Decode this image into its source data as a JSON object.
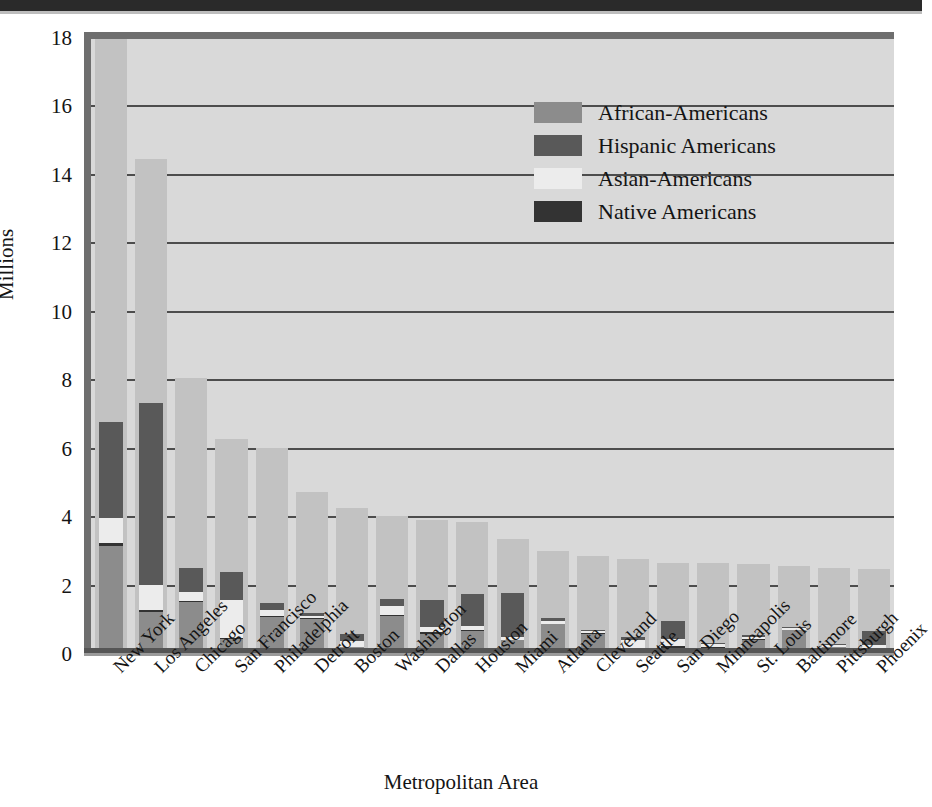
{
  "axis": {
    "y_label": "Millions",
    "x_label": "Metropolitan Area",
    "y_ticks": [
      "0",
      "2",
      "4",
      "6",
      "8",
      "10",
      "12",
      "14",
      "16",
      "18"
    ]
  },
  "legend": {
    "items": [
      {
        "label": "African-Americans",
        "color": "#8c8c8c"
      },
      {
        "label": "Hispanic Americans",
        "color": "#595959"
      },
      {
        "label": "Asian-Americans",
        "color": "#ececec"
      },
      {
        "label": "Native Americans",
        "color": "#333333"
      }
    ]
  },
  "chart_data": {
    "type": "bar",
    "subtype": "stacked-bar-with-total-background",
    "title": "",
    "xlabel": "Metropolitan Area",
    "ylabel": "Millions",
    "ylim": [
      0,
      18
    ],
    "yticks": [
      0,
      2,
      4,
      6,
      8,
      10,
      12,
      14,
      16,
      18
    ],
    "grid": true,
    "legend_position": "inside-top-right",
    "categories": [
      "New York",
      "Los Angeles",
      "Chicago",
      "San Francisco",
      "Philadelphia",
      "Detroit",
      "Boston",
      "Washington",
      "Dallas",
      "Houston",
      "Miami",
      "Atlanta",
      "Cleveland",
      "Seattle",
      "San Diego",
      "Minneapolis",
      "St. Louis",
      "Baltimore",
      "Pittsburgh",
      "Phoenix"
    ],
    "total_series": {
      "name": "Total metropolitan population",
      "color": "#c2c2c2",
      "values": [
        19.8,
        14.5,
        8.1,
        6.3,
        6.05,
        4.75,
        4.3,
        4.05,
        3.95,
        3.9,
        3.4,
        3.05,
        2.9,
        2.8,
        2.7,
        2.7,
        2.65,
        2.6,
        2.55,
        2.5
      ]
    },
    "series": [
      {
        "name": "African-Americans",
        "color": "#8c8c8c",
        "values": [
          3.2,
          1.25,
          1.55,
          0.48,
          1.12,
          1.05,
          0.22,
          1.15,
          0.62,
          0.7,
          0.43,
          0.9,
          0.62,
          0.16,
          0.2,
          0.18,
          0.45,
          0.72,
          0.22,
          0.12
        ]
      },
      {
        "name": "Native Americans",
        "color": "#333333",
        "values": [
          0.08,
          0.07,
          0.03,
          0.02,
          0.03,
          0.03,
          0.02,
          0.02,
          0.04,
          0.03,
          0.02,
          0.02,
          0.02,
          0.05,
          0.05,
          0.05,
          0.03,
          0.02,
          0.02,
          0.08
        ]
      },
      {
        "name": "Asian-Americans",
        "color": "#ececec",
        "values": [
          0.72,
          0.73,
          0.27,
          1.1,
          0.16,
          0.07,
          0.16,
          0.25,
          0.16,
          0.13,
          0.09,
          0.08,
          0.05,
          0.24,
          0.22,
          0.09,
          0.06,
          0.06,
          0.04,
          0.08
        ]
      },
      {
        "name": "Hispanic Americans",
        "color": "#595959",
        "values": [
          2.8,
          5.3,
          0.7,
          0.82,
          0.2,
          0.09,
          0.22,
          0.22,
          0.78,
          0.92,
          1.28,
          0.08,
          0.05,
          0.09,
          0.52,
          0.04,
          0.05,
          0.02,
          0.02,
          0.42
        ]
      }
    ]
  }
}
